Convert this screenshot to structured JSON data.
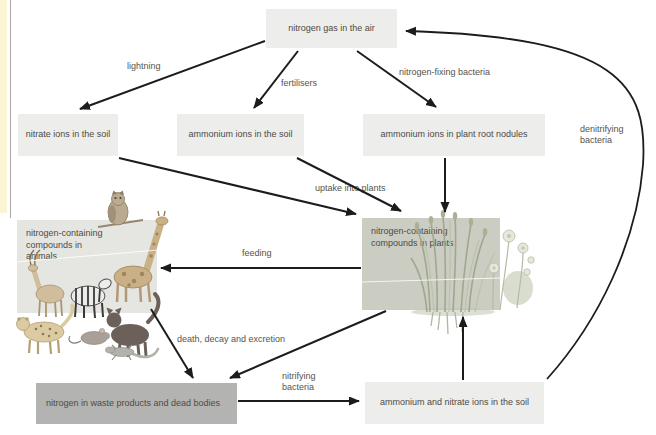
{
  "diagram": {
    "type": "flow-diagram",
    "nodes": {
      "nitrogen_gas_air": "nitrogen gas in the air",
      "nitrate_ions_soil": "nitrate ions in the soil",
      "ammonium_ions_soil": "ammonium ions in the soil",
      "ammonium_ions_nodules": "ammonium ions in plant root nodules",
      "compounds_plants": "nitrogen-containing compounds in plants",
      "compounds_animals": "nitrogen-containing compounds in animals",
      "waste_dead_bodies": "nitrogen in waste products and dead bodies",
      "ammonium_nitrate_soil": "ammonium and nitrate ions in the soil"
    },
    "edge_labels": {
      "lightning": "lightning",
      "fertilisers": "fertilisers",
      "nitrogen_fixing_bacteria": "nitrogen-fixing bacteria",
      "uptake_into_plants": "uptake into plants",
      "feeding": "feeding",
      "death_decay_excretion": "death, decay and excretion",
      "nitrifying_bacteria": "nitrifying bacteria",
      "denitrifying_bacteria": "denitrifying bacteria"
    },
    "colors": {
      "box_light": "#ededeb",
      "box_plants": "#cbcdc2",
      "box_animals": "#e5e5e1",
      "box_waste": "#b3b3b1",
      "arrow": "#1c1c1c",
      "text": "#4e4b46",
      "page_edge": "#fbf5d3"
    },
    "icons": [
      "owl-icon",
      "giraffe-icon",
      "zebra-icon",
      "antelope-icon",
      "leopard-icon",
      "mouse-icon",
      "cat-icon",
      "lizard-icon",
      "plants-icon"
    ]
  }
}
